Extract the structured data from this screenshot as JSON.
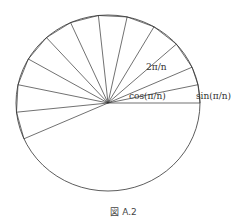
{
  "figure": {
    "caption": "図 A.2",
    "labels": {
      "angle": "2π/n",
      "cos": "cos(π/n)",
      "sin": "sin(π/n)"
    },
    "circle": {
      "cx": 108,
      "cy": 103,
      "rx": 92,
      "ry": 88
    },
    "spoke_angles_deg": [
      0,
      12,
      24,
      42,
      60,
      78,
      96,
      114,
      132,
      150,
      168,
      186,
      204
    ],
    "colors": {
      "stroke": "#333333"
    }
  }
}
